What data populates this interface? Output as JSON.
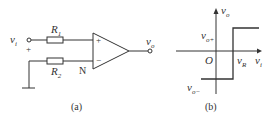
{
  "figure_a": {
    "input_label": "v",
    "input_sub": "i",
    "plus_sign": "+",
    "r1_label": "R",
    "r1_sub": "1",
    "r2_label": "R",
    "r2_sub": "2",
    "node_label": "N",
    "opamp_plus": "+",
    "opamp_minus": "−",
    "output_label": "v",
    "output_sub": "o",
    "caption": "(a)"
  },
  "figure_b": {
    "y_axis_label": "v",
    "y_axis_sub": "o",
    "x_axis_label": "v",
    "x_axis_sub": "i",
    "voh_label": "v",
    "voh_sub": "o+",
    "vol_label": "v",
    "vol_sub": "o−",
    "origin_label": "O",
    "threshold_label": "v",
    "threshold_sub": "R",
    "caption": "(b)"
  },
  "colors": {
    "line": "#333333",
    "background": "#ffffff"
  }
}
